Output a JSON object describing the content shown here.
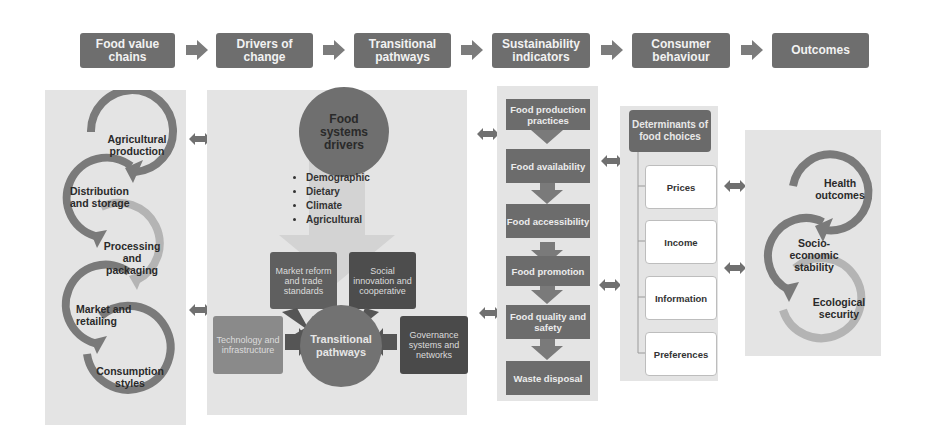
{
  "header": {
    "stages": [
      {
        "label": "Food value\nchains"
      },
      {
        "label": "Drivers of\nchange"
      },
      {
        "label": "Transitional\npathways"
      },
      {
        "label": "Sustainability\nindicators"
      },
      {
        "label": "Consumer\nbehaviour"
      },
      {
        "label": "Outcomes"
      }
    ]
  },
  "food_value_chain": {
    "steps": [
      "Agricultural production",
      "Distribution and storage",
      "Processing and packaging",
      "Market and retailing",
      "Consumption styles"
    ]
  },
  "drivers": {
    "circle_title": "Food systems drivers",
    "bullets": [
      "Demographic",
      "Dietary",
      "Climate",
      "Agricultural"
    ],
    "pathways_center": "Transitional pathways",
    "pathway_inputs": [
      "Market reform and trade standards",
      "Social innovation and cooperative",
      "Technology and infrastructure",
      "Governance systems and networks"
    ]
  },
  "sustainability_indicators": {
    "steps": [
      "Food production practices",
      "Food availability",
      "Food accessibility",
      "Food promotion",
      "Food quality and safety",
      "Waste disposal"
    ]
  },
  "consumer_behaviour": {
    "title": "Determinants of food choices",
    "items": [
      "Prices",
      "Income",
      "Information",
      "Preferences"
    ]
  },
  "outcomes": {
    "items": [
      "Health outcomes",
      "Socio-economic stability",
      "Ecological security"
    ]
  },
  "colors": {
    "header_box": "#6e6e6e",
    "panel_bg": "#e4e4e4",
    "dark_step": "#6c6c6c",
    "arrow": "#808080",
    "light_arc": "#b4b4b4"
  }
}
